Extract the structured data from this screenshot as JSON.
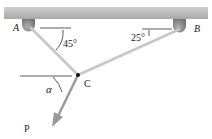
{
  "diagram": {
    "type": "two-cable system",
    "labels": {
      "A": "A",
      "B": "B",
      "C": "C",
      "P": "P",
      "angle_A": "45°",
      "angle_B": "25°",
      "angle_alpha": "α"
    },
    "colors": {
      "ceiling": "#b8b8b8",
      "cable": "#c9c9c9",
      "support": "#8a8a8a",
      "ink": "#222222"
    }
  }
}
